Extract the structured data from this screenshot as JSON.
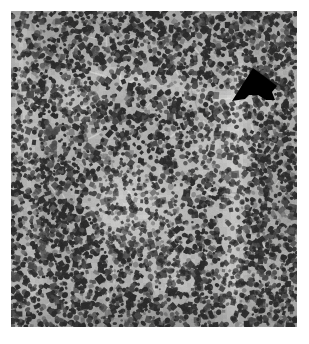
{
  "figure": {
    "domain": "Natural-Image",
    "kind": "histopathology-micrograph",
    "caption_text": "",
    "canvas": {
      "width": 309,
      "height": 344,
      "background_hex": "#ffffff"
    }
  },
  "micrograph": {
    "name": "lymphoid-tissue-section",
    "stain_appearance": "grayscale-h-and-e",
    "frame": {
      "x": 11,
      "y": 11,
      "width": 286,
      "height": 316
    },
    "palette": {
      "background_hex": "#ffffff",
      "tissue_light_hex": "#d8d8d8",
      "tissue_mid_hex": "#b0b0b0",
      "tissue_dark_hex": "#8a8a8a",
      "nucleus_hex": "#2b2b2b",
      "nucleus_soft_hex": "#4a4a4a",
      "pale_zone_hex": "#c9c9c9",
      "annotation_hex": "#000000"
    },
    "texture": {
      "nucleus_count": 5200,
      "nucleus_min_radius": 1.1,
      "nucleus_max_radius": 2.6,
      "stroma_streak_count": 150,
      "grain_opacity": 0.18,
      "random_seed": 20250411
    },
    "regions": [
      {
        "name": "germinal-center-pale-zone",
        "cx": 132,
        "cy": 205,
        "rx": 52,
        "ry": 46,
        "lightness": 26,
        "density": 0.62
      },
      {
        "name": "pale-zone-upper-left",
        "cx": 70,
        "cy": 95,
        "rx": 34,
        "ry": 30,
        "lightness": 14,
        "density": 0.86
      },
      {
        "name": "pale-zone-mid-right",
        "cx": 212,
        "cy": 150,
        "rx": 30,
        "ry": 40,
        "lightness": 16,
        "density": 0.8
      },
      {
        "name": "pale-zone-lower-mid",
        "cx": 175,
        "cy": 280,
        "rx": 40,
        "ry": 32,
        "lightness": 12,
        "density": 0.84
      },
      {
        "name": "dense-mantle-left",
        "cx": 46,
        "cy": 215,
        "rx": 38,
        "ry": 58,
        "lightness": -16,
        "density": 1.3
      },
      {
        "name": "dense-zone-top-left",
        "cx": 58,
        "cy": 40,
        "rx": 44,
        "ry": 30,
        "lightness": -12,
        "density": 1.22
      },
      {
        "name": "dense-zone-top-right",
        "cx": 250,
        "cy": 45,
        "rx": 42,
        "ry": 32,
        "lightness": -12,
        "density": 1.24
      },
      {
        "name": "dense-zone-bottom",
        "cx": 150,
        "cy": 318,
        "rx": 130,
        "ry": 26,
        "lightness": -10,
        "density": 1.2
      },
      {
        "name": "dense-zone-right-edge",
        "cx": 286,
        "cy": 200,
        "rx": 26,
        "ry": 90,
        "lightness": -14,
        "density": 1.25
      }
    ],
    "vascular_bands": [
      {
        "name": "sinus-band-vertical-right",
        "x1": 238,
        "y1": 60,
        "x2": 231,
        "y2": 330,
        "width": 11,
        "lightness": 22
      },
      {
        "name": "sinus-band-diagonal-upper",
        "x1": 100,
        "y1": 70,
        "x2": 270,
        "y2": 108,
        "width": 7,
        "lightness": 14
      },
      {
        "name": "capsule-band-left",
        "x1": 22,
        "y1": 30,
        "x2": 34,
        "y2": 300,
        "width": 8,
        "lightness": 16
      }
    ]
  },
  "annotations": [
    {
      "name": "pointer-arrow",
      "shape": "solid-filled-arrow",
      "direction": "down-left",
      "color_hex": "#000000",
      "points": "253,68 232,101 245,99 249,95 258,95 266,100 275,100 272,92 277,86 268,79"
    }
  ]
}
